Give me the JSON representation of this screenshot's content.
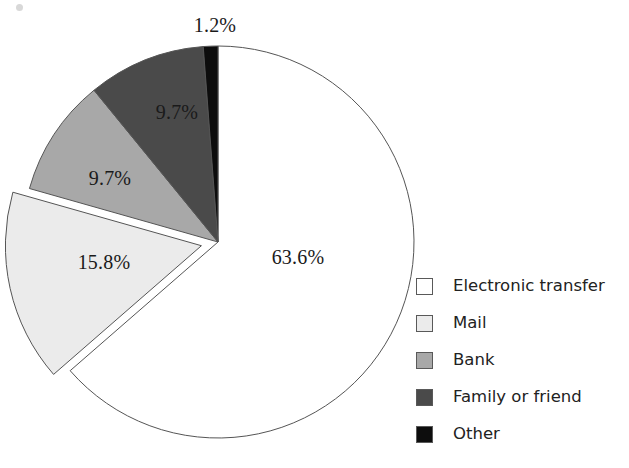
{
  "chart_data": {
    "type": "pie",
    "title": "",
    "categories": [
      "Electronic transfer",
      "Mail",
      "Bank",
      "Family or friend",
      "Other"
    ],
    "values": [
      63.6,
      15.8,
      9.7,
      9.7,
      1.2
    ],
    "value_unit": "%",
    "data_labels": [
      "63.6%",
      "15.8%",
      "9.7%",
      "9.7%",
      "1.2%"
    ],
    "colors": [
      "#ffffff",
      "#ebebeb",
      "#a8a8a8",
      "#4a4a4a",
      "#0d0d0d"
    ],
    "slice_border_color": "#555555",
    "exploded_slices": [
      "Mail"
    ],
    "start_angle_deg": 0,
    "direction": "clockwise",
    "legend_position": "right",
    "grid": false,
    "xlabel": "",
    "ylabel": ""
  },
  "pie": {
    "center_x": 218,
    "center_y": 242,
    "radius": 196,
    "slices": [
      {
        "name": "Electronic transfer",
        "label": "63.6%",
        "value": 63.6,
        "color": "#ffffff",
        "start_deg": 0,
        "end_deg": 228.96,
        "exploded": false,
        "label_x": 298,
        "label_y": 257
      },
      {
        "name": "Mail",
        "label": "15.8%",
        "value": 15.8,
        "color": "#ebebeb",
        "start_deg": 228.96,
        "end_deg": 285.84,
        "exploded": true,
        "label_x": 104,
        "label_y": 262
      },
      {
        "name": "Bank",
        "label": "9.7%",
        "value": 9.7,
        "color": "#a8a8a8",
        "start_deg": 285.84,
        "end_deg": 320.76,
        "exploded": false,
        "label_x": 110,
        "label_y": 178
      },
      {
        "name": "Family or friend",
        "label": "9.7%",
        "value": 9.7,
        "color": "#4a4a4a",
        "start_deg": 320.76,
        "end_deg": 355.68,
        "exploded": false,
        "label_x": 177,
        "label_y": 112
      },
      {
        "name": "Other",
        "label": "1.2%",
        "value": 1.2,
        "color": "#0d0d0d",
        "start_deg": 355.68,
        "end_deg": 360,
        "exploded": false,
        "label_x": 215,
        "label_y": 25
      }
    ]
  },
  "legend": {
    "items": [
      {
        "label": "Electronic transfer",
        "color": "#ffffff"
      },
      {
        "label": "Mail",
        "color": "#ebebeb"
      },
      {
        "label": "Bank",
        "color": "#a8a8a8"
      },
      {
        "label": "Family or friend",
        "color": "#4a4a4a"
      },
      {
        "label": "Other",
        "color": "#0d0d0d"
      }
    ]
  }
}
